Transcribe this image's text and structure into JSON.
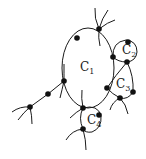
{
  "diagram": {
    "type": "graph-with-cycles",
    "labels": [
      {
        "id": "C1",
        "base": "C",
        "sub": "1",
        "x": 80,
        "y": 68
      },
      {
        "id": "C2",
        "base": "C",
        "sub": "2",
        "x": 122,
        "y": 45
      },
      {
        "id": "C3",
        "base": "C",
        "sub": "3",
        "x": 116,
        "y": 79
      },
      {
        "id": "C4",
        "base": "C",
        "sub": "4",
        "x": 88,
        "y": 116
      }
    ],
    "nodes": [
      {
        "x": 77,
        "y": 38
      },
      {
        "x": 99,
        "y": 29
      },
      {
        "x": 64,
        "y": 81
      },
      {
        "x": 48,
        "y": 94
      },
      {
        "x": 30,
        "y": 107
      },
      {
        "x": 83,
        "y": 108
      },
      {
        "x": 99,
        "y": 115
      },
      {
        "x": 83,
        "y": 129
      },
      {
        "x": 107,
        "y": 88
      },
      {
        "x": 113,
        "y": 57
      },
      {
        "x": 128,
        "y": 42
      },
      {
        "x": 127,
        "y": 62
      },
      {
        "x": 120,
        "y": 98
      },
      {
        "x": 133,
        "y": 92
      }
    ],
    "colors": {
      "stroke": "#1a1a1a",
      "node": "#111111",
      "background": "#ffffff"
    }
  }
}
